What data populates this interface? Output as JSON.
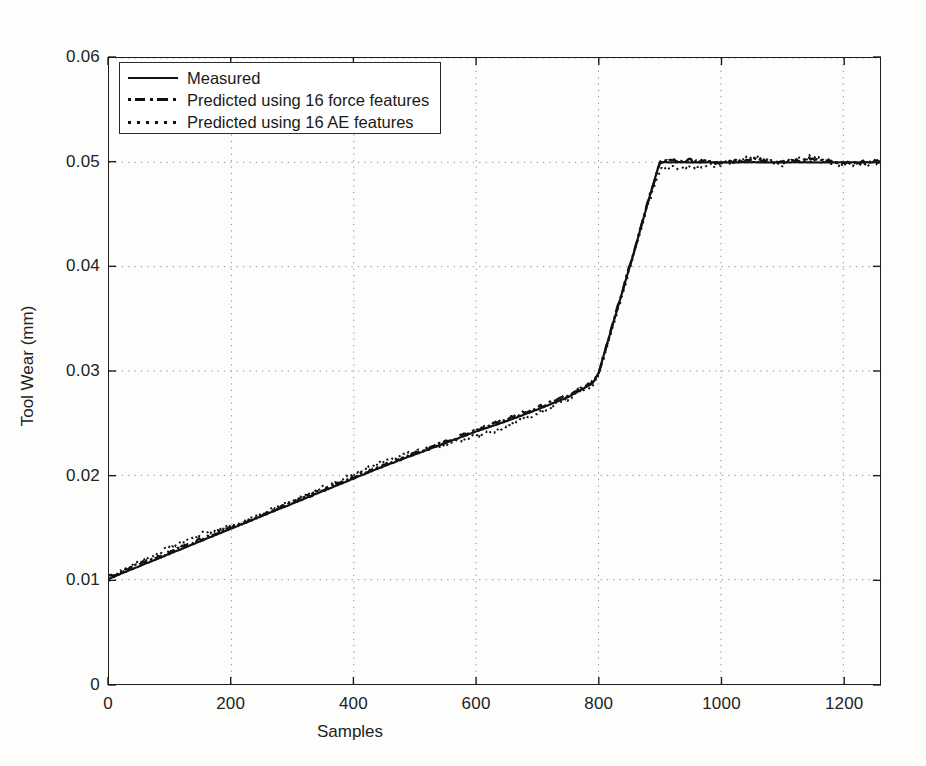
{
  "chart_data": {
    "type": "line",
    "title": "",
    "xlabel": "Samples",
    "ylabel": "Tool Wear (mm)",
    "xlim": [
      0,
      1260
    ],
    "ylim": [
      0,
      0.06
    ],
    "xticks": [
      0,
      200,
      400,
      600,
      800,
      1000,
      1200
    ],
    "xticklabels": [
      "0",
      "200",
      "400",
      "600",
      "800",
      "1000",
      "1200"
    ],
    "yticks": [
      0,
      0.01,
      0.02,
      0.03,
      0.04,
      0.05,
      0.06
    ],
    "yticklabels": [
      "0",
      "0.01",
      "0.02",
      "0.03",
      "0.04",
      "0.05",
      "0.06"
    ],
    "grid": "dotted",
    "legend_position": "upper-left",
    "series": [
      {
        "name": "Measured",
        "style": "solid",
        "color": "#111111",
        "x": [
          0,
          50,
          100,
          150,
          200,
          250,
          300,
          350,
          400,
          450,
          500,
          550,
          600,
          650,
          700,
          750,
          790,
          800,
          820,
          840,
          860,
          880,
          900,
          905,
          950,
          1000,
          1050,
          1100,
          1150,
          1200,
          1260
        ],
        "y": [
          0.0101,
          0.0113,
          0.0125,
          0.0137,
          0.0149,
          0.0161,
          0.0173,
          0.0185,
          0.0197,
          0.0209,
          0.022,
          0.0231,
          0.0242,
          0.0252,
          0.0263,
          0.0275,
          0.0288,
          0.0298,
          0.0338,
          0.0378,
          0.0418,
          0.046,
          0.05,
          0.05,
          0.05,
          0.05,
          0.05,
          0.05,
          0.05,
          0.05,
          0.05
        ]
      },
      {
        "name": "Predicted using 16 force features",
        "style": "dash-dot",
        "color": "#111111",
        "x": [
          0,
          50,
          100,
          150,
          200,
          250,
          300,
          350,
          400,
          450,
          500,
          550,
          600,
          650,
          700,
          750,
          790,
          800,
          820,
          840,
          860,
          880,
          900,
          905,
          950,
          1000,
          1050,
          1100,
          1150,
          1200,
          1260
        ],
        "y": [
          0.0103,
          0.0115,
          0.0126,
          0.0139,
          0.015,
          0.0162,
          0.0174,
          0.0186,
          0.0198,
          0.021,
          0.0221,
          0.0232,
          0.0243,
          0.0254,
          0.0265,
          0.0277,
          0.0289,
          0.0297,
          0.0339,
          0.0379,
          0.0419,
          0.0461,
          0.0499,
          0.0501,
          0.0502,
          0.0499,
          0.0503,
          0.05,
          0.0504,
          0.0499,
          0.0501
        ]
      },
      {
        "name": "Predicted using 16 AE features",
        "style": "dotted",
        "color": "#111111",
        "x": [
          0,
          50,
          100,
          150,
          200,
          250,
          300,
          350,
          400,
          450,
          500,
          550,
          600,
          650,
          700,
          750,
          790,
          800,
          820,
          840,
          860,
          880,
          900,
          905,
          950,
          1000,
          1050,
          1100,
          1150,
          1200,
          1260
        ],
        "y": [
          0.01,
          0.0117,
          0.0131,
          0.0144,
          0.0152,
          0.0163,
          0.0175,
          0.0189,
          0.0201,
          0.0214,
          0.0222,
          0.0229,
          0.0238,
          0.0246,
          0.026,
          0.0273,
          0.0286,
          0.0296,
          0.0335,
          0.0375,
          0.0416,
          0.0458,
          0.0493,
          0.0494,
          0.0496,
          0.0498,
          0.0505,
          0.0498,
          0.0506,
          0.0497,
          0.05
        ]
      }
    ]
  },
  "axes": {
    "x_title": "Samples",
    "y_title": "Tool Wear (mm)"
  },
  "legend": {
    "entries": [
      {
        "label": "Measured",
        "style": "solid"
      },
      {
        "label": "Predicted using 16 force features",
        "style": "dash-dot"
      },
      {
        "label": "Predicted using 16 AE features",
        "style": "dotted"
      }
    ]
  }
}
